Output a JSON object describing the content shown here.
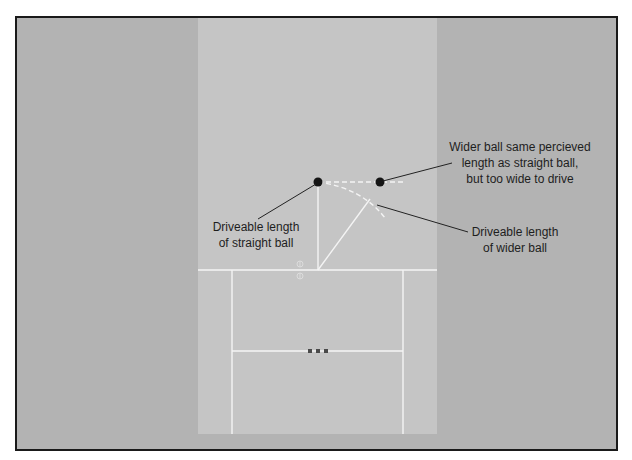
{
  "diagram": {
    "colors": {
      "outfield": "#b3b3b3",
      "pitch": "#c5c5c5",
      "crease": "#f4f4f4",
      "ball": "#151515",
      "stump": "#4a4a4a",
      "leader": "#222222",
      "border": "#1a1a1a"
    },
    "labels": {
      "straight_ball": [
        "Driveable length",
        "of straight ball"
      ],
      "wider_ball_same_length": [
        "Wider ball same percieved",
        "length as straight ball,",
        "but too wide to drive"
      ],
      "wider_ball_driveable": [
        "Driveable length",
        "of wider ball"
      ]
    },
    "elements": {
      "straight_ball_position": {
        "x": 318,
        "y": 182
      },
      "wide_ball_position": {
        "x": 380,
        "y": 182
      },
      "stumps_count": 3
    }
  }
}
